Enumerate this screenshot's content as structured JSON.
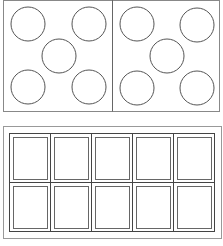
{
  "colors": {
    "background": "#ffffff",
    "stroke": "#555555",
    "frame": "#888888"
  },
  "top_panel": {
    "description": "Two ten-frame style halves each showing five circles (dice-five pattern)",
    "left_half_circles": 5,
    "right_half_circles": 5,
    "total_circles": 10
  },
  "bottom_panel": {
    "description": "Ten-frame grid with 2 rows and 5 columns of empty boxes",
    "rows": 2,
    "columns": 5,
    "total_cells": 10
  }
}
